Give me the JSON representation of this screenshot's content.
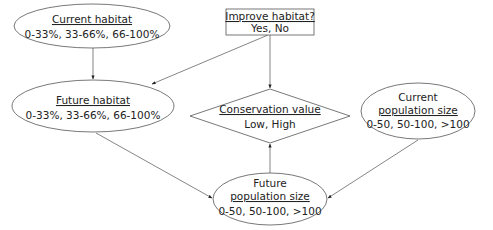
{
  "diagram": {
    "type": "bayesian-network",
    "nodes": {
      "current_habitat": {
        "shape": "ellipse",
        "title": "Current habitat",
        "states": "0-33%, 33-66%, 66-100%"
      },
      "improve_habitat": {
        "shape": "rectangle",
        "title": "Improve habitat?",
        "states": "Yes, No"
      },
      "future_habitat": {
        "shape": "ellipse",
        "title": "Future habitat",
        "states": "0-33%, 33-66%, 66-100%"
      },
      "conservation_value": {
        "shape": "diamond",
        "title": "Conservation value",
        "states": "Low, High"
      },
      "current_population": {
        "shape": "ellipse",
        "title_line1": "Current",
        "title_line2": "population size",
        "states": "0-50, 50-100, >100"
      },
      "future_population": {
        "shape": "ellipse",
        "title_line1": "Future",
        "title_line2": "population size",
        "states": "0-50, 50-100, >100"
      }
    },
    "edges": [
      {
        "from": "current_habitat",
        "to": "future_habitat"
      },
      {
        "from": "improve_habitat",
        "to": "future_habitat"
      },
      {
        "from": "improve_habitat",
        "to": "conservation_value"
      },
      {
        "from": "future_habitat",
        "to": "future_population"
      },
      {
        "from": "current_population",
        "to": "future_population"
      },
      {
        "from": "future_population",
        "to": "conservation_value"
      }
    ]
  }
}
